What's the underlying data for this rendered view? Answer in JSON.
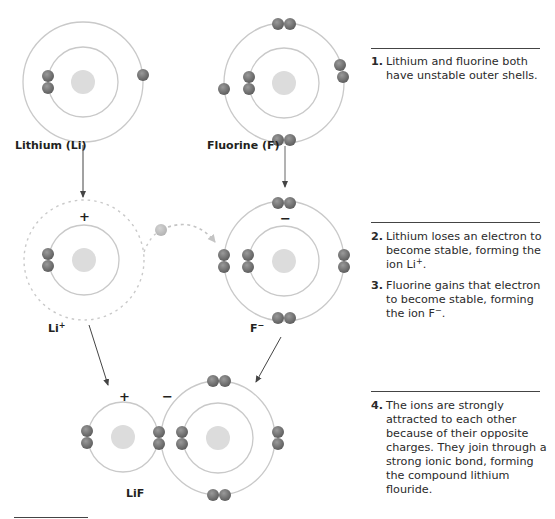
{
  "colors": {
    "orbit": "#c9c9c9",
    "nucleus": "#dcdcdc",
    "electron": "#6d6d6d",
    "electron_light": "#bdbdbd",
    "arrow": "#444444",
    "text": "#231f20"
  },
  "atoms": {
    "lithium": {
      "label": "Lithium (Li)"
    },
    "fluorine": {
      "label": "Fluorine (F)"
    },
    "lithium_ion": {
      "label_base": "Li",
      "label_charge": "+",
      "charge": "+"
    },
    "fluoride_ion": {
      "label_base": "F",
      "label_charge": "−",
      "charge": "−"
    },
    "compound": {
      "label": "LiF",
      "li_charge": "+",
      "f_charge": "−"
    }
  },
  "steps": [
    {
      "number": "1.",
      "text": "Lithium and fluorine both have unstable outer shells."
    },
    {
      "number": "2.",
      "text_before": "Lithium loses an electron to become stable, forming the ion Li",
      "sup": "+",
      "text_after": "."
    },
    {
      "number": "3.",
      "text_before": "Fluorine gains that electron to become stable, forming the ion F",
      "sup": "−",
      "text_after": "."
    },
    {
      "number": "4.",
      "text": "The ions are strongly attracted to each other because of their opposite charges. They join through a strong ionic bond, forming the compound lithium flouride."
    }
  ]
}
